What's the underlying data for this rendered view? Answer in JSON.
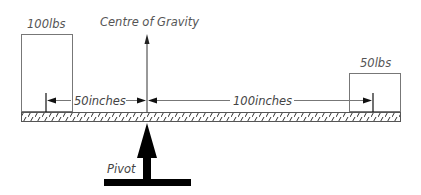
{
  "diagram": {
    "left_weight": {
      "label": "100lbs",
      "value": 100,
      "unit": "lbs"
    },
    "right_weight": {
      "label": "50lbs",
      "value": 50,
      "unit": "lbs"
    },
    "centre_of_gravity": {
      "label": "Centre of Gravity"
    },
    "pivot": {
      "label": "Pivot"
    },
    "left_distance": {
      "label": "50inches",
      "value": 50,
      "unit": "inches"
    },
    "right_distance": {
      "label": "100inches",
      "value": 100,
      "unit": "inches"
    }
  },
  "colors": {
    "stroke": "#555555",
    "fill": "#000000",
    "background": "#ffffff"
  }
}
